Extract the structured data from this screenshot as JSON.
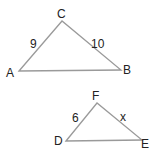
{
  "diagram": {
    "triangles": [
      {
        "name": "ABC",
        "vertices": [
          {
            "label": "A",
            "x": 19,
            "y": 71
          },
          {
            "label": "C",
            "x": 62,
            "y": 21
          },
          {
            "label": "B",
            "x": 121,
            "y": 70
          }
        ],
        "side_labels": [
          {
            "side": "AC",
            "text": "9"
          },
          {
            "side": "CB",
            "text": "10"
          }
        ]
      },
      {
        "name": "DFE",
        "vertices": [
          {
            "label": "D",
            "x": 66,
            "y": 141
          },
          {
            "label": "F",
            "x": 97,
            "y": 103
          },
          {
            "label": "E",
            "x": 142,
            "y": 140
          }
        ],
        "side_labels": [
          {
            "side": "DF",
            "text": "6"
          },
          {
            "side": "FE",
            "text": "x"
          }
        ]
      }
    ],
    "line_color": "#9a9a9a",
    "text_color": "#222222"
  }
}
